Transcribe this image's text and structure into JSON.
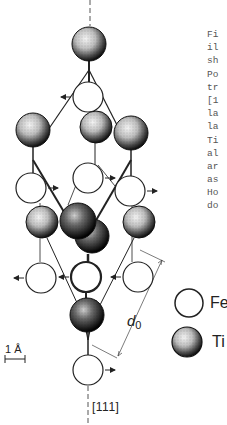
{
  "figure": {
    "axis_label": "[111]",
    "scale_bar_label": "1 Å",
    "lattice_param_label": "d",
    "lattice_param_sub": "0",
    "legend": [
      {
        "symbol": "open-circle",
        "label": "Fe"
      },
      {
        "symbol": "stippled-sphere",
        "label": "Ti"
      }
    ],
    "caption_fragments": [
      "Fi",
      "il",
      "sh",
      "Po",
      "tr",
      "[1",
      "la",
      "la",
      "Ti",
      "al",
      "ar",
      "as",
      "Ho",
      "do"
    ],
    "atoms": [
      {
        "type": "Ti",
        "x": 89,
        "y": 44,
        "r": 17
      },
      {
        "type": "Fe",
        "x": 88,
        "y": 97,
        "r": 15,
        "arrow": "left"
      },
      {
        "type": "Ti",
        "x": 33,
        "y": 130,
        "r": 17
      },
      {
        "type": "Ti",
        "x": 96,
        "y": 127,
        "r": 16
      },
      {
        "type": "Ti",
        "x": 131,
        "y": 133,
        "r": 17
      },
      {
        "type": "Fe",
        "x": 31,
        "y": 188,
        "r": 15,
        "arrow": "right"
      },
      {
        "type": "Fe",
        "x": 88,
        "y": 178,
        "r": 15,
        "arrow": "right"
      },
      {
        "type": "Fe",
        "x": 130,
        "y": 191,
        "r": 15,
        "arrow": "right"
      },
      {
        "type": "Ti",
        "x": 42,
        "y": 222,
        "r": 16
      },
      {
        "type": "Ti",
        "x": 92,
        "y": 236,
        "r": 17
      },
      {
        "type": "Ti",
        "x": 78,
        "y": 221,
        "r": 18
      },
      {
        "type": "Ti",
        "x": 139,
        "y": 222,
        "r": 16
      },
      {
        "type": "Fe",
        "x": 41,
        "y": 278,
        "r": 15,
        "arrow": "left"
      },
      {
        "type": "Fe",
        "x": 86,
        "y": 277,
        "r": 15,
        "arrow": "left"
      },
      {
        "type": "Fe",
        "x": 138,
        "y": 277,
        "r": 15,
        "arrow": "left"
      },
      {
        "type": "Ti",
        "x": 87,
        "y": 315,
        "r": 17
      },
      {
        "type": "Fe",
        "x": 88,
        "y": 370,
        "r": 15,
        "arrow": "right"
      }
    ]
  }
}
